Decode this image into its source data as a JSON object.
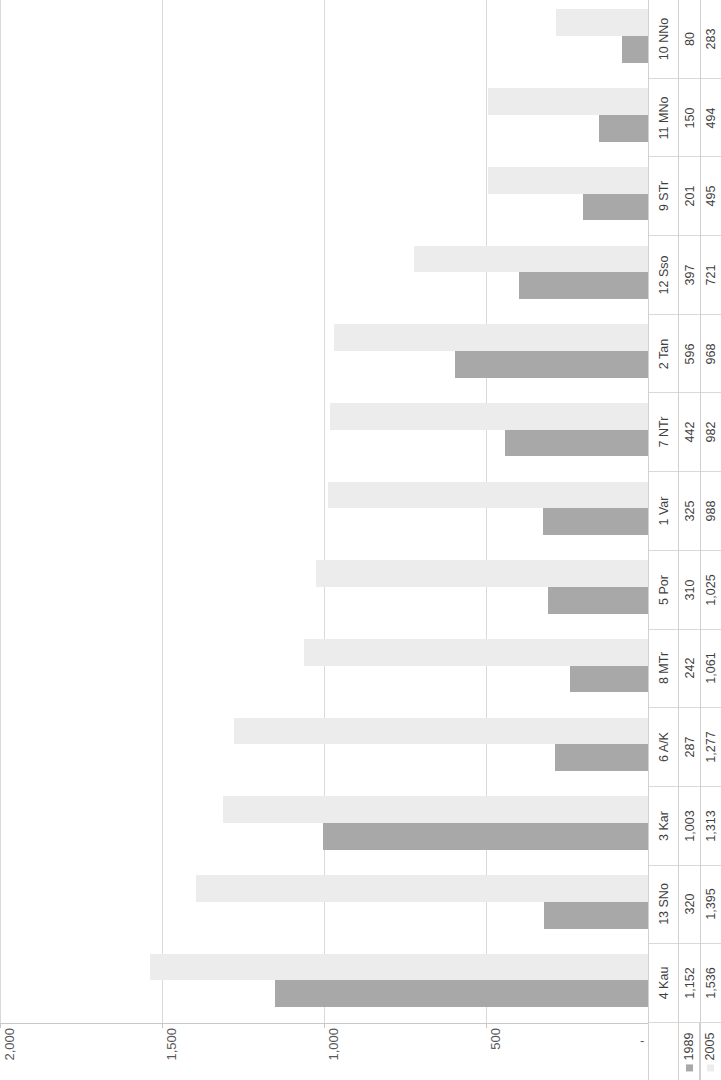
{
  "chart_data": {
    "type": "bar",
    "orientation": "horizontal",
    "title": "",
    "subtitle": "",
    "xlabel": "",
    "ylabel": "",
    "xlim": [
      0,
      2000
    ],
    "grid": true,
    "grid_axis": "value",
    "legend_position": "bottom-right",
    "axis_direction": "right-to-left",
    "zero_tick_label": "-",
    "tick_labels": [
      "2,000",
      "1,500",
      "1,000",
      "500",
      "-"
    ],
    "tick_values": [
      2000,
      1500,
      1000,
      500,
      0
    ],
    "categories": [
      "10 NNo",
      "11 MNo",
      "9 STr",
      "12 Sso",
      "2 Tan",
      "7 NTr",
      "1 Var",
      "5 Por",
      "8 MTr",
      "6 A/K",
      "3 Kar",
      "13 SNo",
      "4 Kau"
    ],
    "series": [
      {
        "name": "1989",
        "color": "#a8a8a8",
        "values": [
          80,
          150,
          201,
          397,
          596,
          442,
          325,
          310,
          242,
          287,
          1003,
          320,
          1152
        ],
        "value_labels": [
          "80",
          "150",
          "201",
          "397",
          "596",
          "442",
          "325",
          "310",
          "242",
          "287",
          "1,003",
          "320",
          "1,152"
        ]
      },
      {
        "name": "2005",
        "color": "#ececec",
        "values": [
          283,
          494,
          495,
          721,
          968,
          982,
          988,
          1025,
          1061,
          1277,
          1313,
          1395,
          1536
        ],
        "value_labels": [
          "283",
          "494",
          "495",
          "721",
          "968",
          "982",
          "988",
          "1,025",
          "1,061",
          "1,277",
          "1,313",
          "1,395",
          "1,536"
        ]
      }
    ]
  },
  "table": {
    "row_header_column": "categories",
    "series_row_labels": [
      "1989",
      "2005"
    ]
  },
  "legend": {
    "entries": [
      {
        "label": "1989",
        "color": "#a8a8a8"
      },
      {
        "label": "2005",
        "color": "#ececec"
      }
    ]
  }
}
